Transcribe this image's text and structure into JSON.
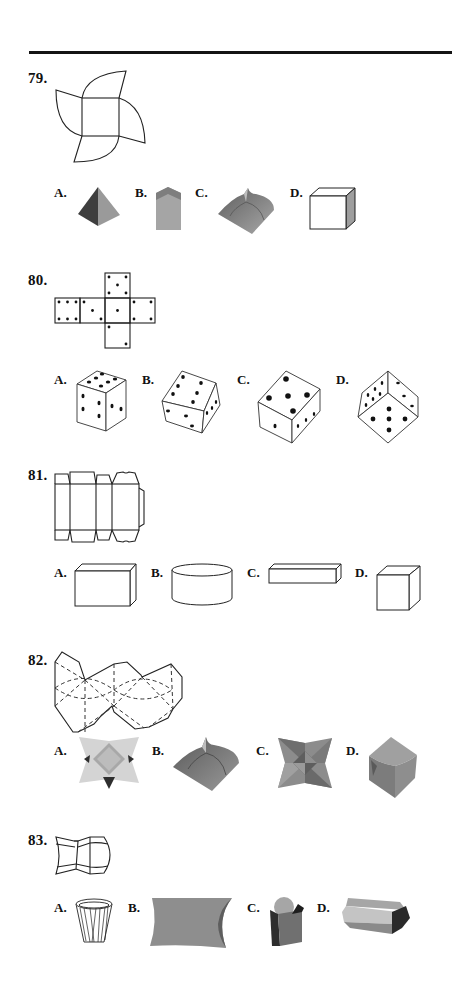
{
  "page": {
    "type": "nonverbal reasoning worksheet — paper folding (nets to 3D shapes)"
  },
  "questions": [
    {
      "number": "79.",
      "figure": "net: central square with four quarter-circle petals arranged in pinwheel",
      "options": [
        {
          "label": "A.",
          "shape": "square pyramid (shaded)"
        },
        {
          "label": "B.",
          "shape": "tall prism with pointed roof (shaded)"
        },
        {
          "label": "C.",
          "shape": "pillow box with curved petals (shaded)"
        },
        {
          "label": "D.",
          "shape": "cube (outline, shaded side)"
        }
      ]
    },
    {
      "number": "80.",
      "figure": "dice cube net",
      "net_faces": {
        "top": 5,
        "row": [
          6,
          3,
          1,
          4
        ],
        "bottom": 2
      },
      "options": [
        {
          "label": "A.",
          "shape": "die showing 5 top, 3 left, 3 right"
        },
        {
          "label": "B.",
          "shape": "tilted die showing 6, 3, 4"
        },
        {
          "label": "C.",
          "shape": "die showing 5 top, 1 left, 3 right"
        },
        {
          "label": "D.",
          "shape": "die corner showing 6, 3, 5"
        }
      ]
    },
    {
      "number": "81.",
      "figure": "box net with four panels and tabs",
      "options": [
        {
          "label": "A.",
          "shape": "rectangular box"
        },
        {
          "label": "B.",
          "shape": "cylinder"
        },
        {
          "label": "C.",
          "shape": "long flat bar"
        },
        {
          "label": "D.",
          "shape": "cube"
        }
      ]
    },
    {
      "number": "82.",
      "figure": "net of hexagonal panels with dashed fold lines and curved creases",
      "options": [
        {
          "label": "A.",
          "shape": "four-point star (light shaded)"
        },
        {
          "label": "B.",
          "shape": "pillow box with curved petals"
        },
        {
          "label": "C.",
          "shape": "four-point star (faceted)"
        },
        {
          "label": "D.",
          "shape": "curved cube"
        }
      ]
    },
    {
      "number": "83.",
      "figure": "bow-tie shaped net with curved edges",
      "options": [
        {
          "label": "A.",
          "shape": "paper cup (outline)"
        },
        {
          "label": "B.",
          "shape": "pillow box"
        },
        {
          "label": "C.",
          "shape": "french fry container"
        },
        {
          "label": "D.",
          "shape": "hexagonal clamshell box"
        }
      ]
    }
  ],
  "colors": {
    "ink": "#222222",
    "shade_dark": "#4a4a4a",
    "shade_mid": "#8a8a8a",
    "shade_light": "#b5b5b5",
    "shade_pale": "#d2d2d2"
  }
}
